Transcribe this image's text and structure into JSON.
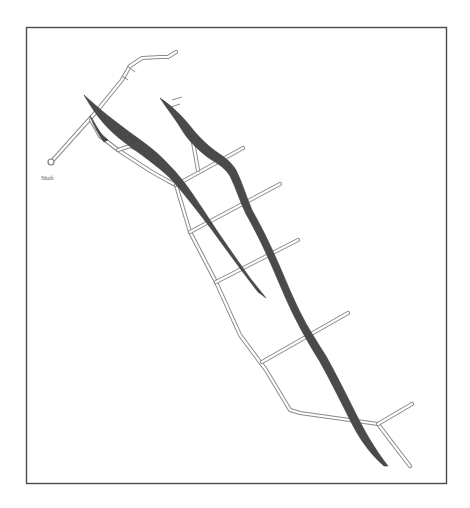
{
  "figure": {
    "type": "mine-plan-diagram",
    "labels": {
      "shaft": "Shaft"
    },
    "colors": {
      "orebody": "#4a4a4a",
      "drift_outline": "#8a8a8a",
      "frame": "#4a4a4a",
      "background": "#ffffff"
    },
    "elements": {
      "orebodies": [
        {
          "name": "orebody-west"
        },
        {
          "name": "orebody-east"
        }
      ],
      "crosscuts_count": 5
    }
  }
}
